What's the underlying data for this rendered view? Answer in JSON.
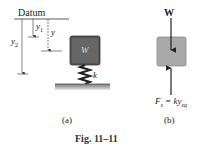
{
  "figure": {
    "caption": "Fig. 11–11",
    "panel_a": {
      "label": "(a)",
      "datum_label": "Datum",
      "y1_label": "y",
      "y1_sub": "1",
      "y_label": "y",
      "y2_label": "y",
      "y2_sub": "2",
      "block_label": "W",
      "spring_label": "k"
    },
    "panel_b": {
      "label": "(b)",
      "weight_label": "W",
      "force_label": "F",
      "force_sub": "s",
      "force_eq": " = ky",
      "force_eq_sub": "eq"
    },
    "colors": {
      "block_dark": "#555555",
      "block_light": "#a9a9a9",
      "ground": "#8a8a8a"
    }
  }
}
